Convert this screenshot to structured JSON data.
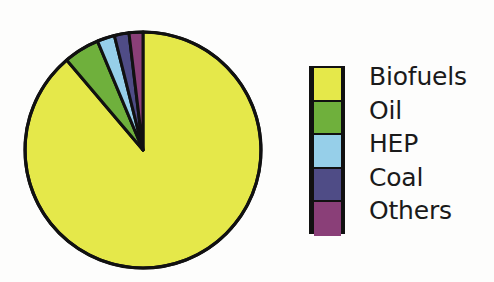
{
  "chart_data": {
    "type": "pie",
    "title": "",
    "subtitle": "",
    "xlabel": "",
    "ylabel": "",
    "grid": false,
    "legend_position": "right",
    "start_angle_deg": 0,
    "direction": "clockwise",
    "categories": [
      "Biofuels",
      "Oil",
      "HEP",
      "Coal",
      "Others"
    ],
    "values": [
      88.8,
      4.9,
      2.4,
      2.0,
      1.9
    ],
    "units": "percent",
    "colors": [
      "#e5e84a",
      "#6fb03c",
      "#96cfe9",
      "#4f4c86",
      "#8a3f78"
    ],
    "slices": [
      {
        "label": "Biofuels",
        "value": 88.8,
        "color": "#e5e84a",
        "angle_deg": 319.7
      },
      {
        "label": "Oil",
        "value": 4.9,
        "color": "#6fb03c",
        "angle_deg": 17.6
      },
      {
        "label": "HEP",
        "value": 2.4,
        "color": "#96cfe9",
        "angle_deg": 8.5
      },
      {
        "label": "Coal",
        "value": 2.0,
        "color": "#4f4c86",
        "angle_deg": 7.2
      },
      {
        "label": "Others",
        "value": 1.9,
        "color": "#8a3f78",
        "angle_deg": 7.0
      }
    ]
  },
  "chart": {
    "outline_color": "#111111",
    "background": "#fdfdfc",
    "center_x": 143,
    "center_y": 150,
    "radius": 118
  },
  "legend": {
    "items": [
      {
        "label": "Biofuels",
        "color": "#e5e84a"
      },
      {
        "label": "Oil",
        "color": "#6fb03c"
      },
      {
        "label": "HEP",
        "color": "#96cfe9"
      },
      {
        "label": "Coal",
        "color": "#4f4c86"
      },
      {
        "label": "Others",
        "color": "#8a3f78"
      }
    ]
  }
}
